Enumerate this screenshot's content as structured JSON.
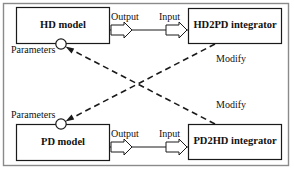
{
  "figure": {
    "frame_color": "#8a8a8a",
    "line_color": "#1a1a1a",
    "boxes": [
      {
        "id": "hd-model",
        "label": "HD model",
        "x": 16,
        "y": 7,
        "w": 94,
        "h": 37
      },
      {
        "id": "hd2pd",
        "label": "HD2PD integrator",
        "x": 188,
        "y": 8,
        "w": 94,
        "h": 36
      },
      {
        "id": "pd-model",
        "label": "PD model",
        "x": 16,
        "y": 124,
        "w": 94,
        "h": 37
      },
      {
        "id": "pd2hd",
        "label": "PD2HD integrator",
        "x": 188,
        "y": 124,
        "w": 94,
        "h": 36
      }
    ],
    "flow_labels": {
      "output_top": "Output",
      "input_top": "Input",
      "output_bottom": "Output",
      "input_bottom": "Input"
    },
    "parameter_labels": {
      "top": "Parameters",
      "bottom": "Parameters"
    },
    "modify_labels": {
      "top": "Modify",
      "bottom": "Modify"
    },
    "connections": [
      {
        "from": "hd2pd",
        "to": "pd-model",
        "style": "dashed",
        "label": "Modify"
      },
      {
        "from": "pd2hd",
        "to": "hd-model",
        "style": "dashed",
        "label": "Modify"
      },
      {
        "from": "hd-model",
        "to": "hd2pd",
        "style": "block-arrow",
        "out": "Output",
        "in": "Input"
      },
      {
        "from": "pd-model",
        "to": "pd2hd",
        "style": "block-arrow",
        "out": "Output",
        "in": "Input"
      }
    ]
  }
}
